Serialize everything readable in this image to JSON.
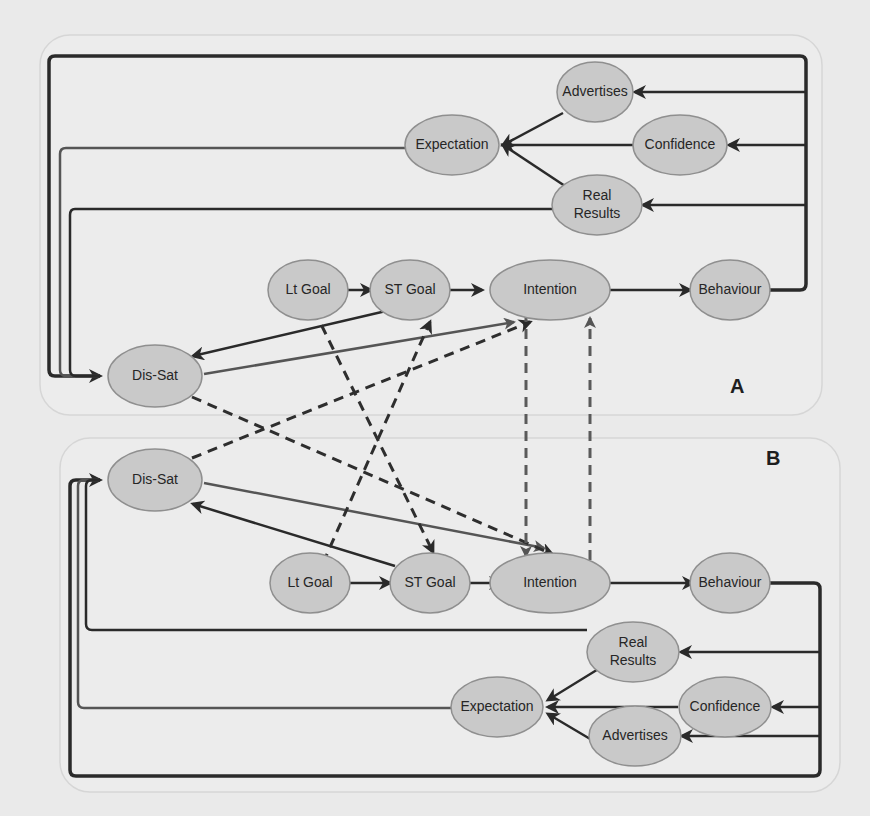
{
  "diagram": {
    "panels": [
      {
        "id": "A",
        "label": "A"
      },
      {
        "id": "B",
        "label": "B"
      }
    ],
    "nodes": {
      "a_advertises": {
        "label": "Advertises"
      },
      "a_expectation": {
        "label": "Expectation"
      },
      "a_confidence": {
        "label": "Confidence"
      },
      "a_real_results_line1": {
        "label": "Real"
      },
      "a_real_results_line2": {
        "label": "Results"
      },
      "a_lt_goal": {
        "label": "Lt Goal"
      },
      "a_st_goal": {
        "label": "ST Goal"
      },
      "a_intention": {
        "label": "Intention"
      },
      "a_behaviour": {
        "label": "Behaviour"
      },
      "a_dis_sat": {
        "label": "Dis-Sat"
      },
      "b_dis_sat": {
        "label": "Dis-Sat"
      },
      "b_lt_goal": {
        "label": "Lt Goal"
      },
      "b_st_goal": {
        "label": "ST Goal"
      },
      "b_intention": {
        "label": "Intention"
      },
      "b_behaviour": {
        "label": "Behaviour"
      },
      "b_real_results_line1": {
        "label": "Real"
      },
      "b_real_results_line2": {
        "label": "Results"
      },
      "b_expectation": {
        "label": "Expectation"
      },
      "b_confidence": {
        "label": "Confidence"
      },
      "b_advertises": {
        "label": "Advertises"
      }
    },
    "edges_solid": [
      {
        "from": "Lt Goal",
        "to": "ST Goal",
        "panel": "A"
      },
      {
        "from": "ST Goal",
        "to": "Intention",
        "panel": "A"
      },
      {
        "from": "Intention",
        "to": "Behaviour",
        "panel": "A"
      },
      {
        "from": "Advertises",
        "to": "Expectation",
        "panel": "A"
      },
      {
        "from": "Confidence",
        "to": "Expectation",
        "panel": "A"
      },
      {
        "from": "Real Results",
        "to": "Expectation",
        "panel": "A"
      },
      {
        "from": "Behaviour",
        "to": "Advertises",
        "panel": "A"
      },
      {
        "from": "Behaviour",
        "to": "Confidence",
        "panel": "A"
      },
      {
        "from": "Behaviour",
        "to": "Real Results",
        "panel": "A"
      },
      {
        "from": "Behaviour",
        "to": "Dis-Sat",
        "panel": "A"
      },
      {
        "from": "Expectation",
        "to": "Dis-Sat",
        "panel": "A"
      },
      {
        "from": "Real Results",
        "to": "Dis-Sat",
        "panel": "A"
      },
      {
        "from": "ST Goal",
        "to": "Dis-Sat",
        "panel": "A"
      },
      {
        "from": "Dis-Sat",
        "to": "Intention",
        "panel": "A"
      },
      {
        "from": "Lt Goal",
        "to": "ST Goal",
        "panel": "B"
      },
      {
        "from": "ST Goal",
        "to": "Intention",
        "panel": "B"
      },
      {
        "from": "Intention",
        "to": "Behaviour",
        "panel": "B"
      },
      {
        "from": "Real Results",
        "to": "Expectation",
        "panel": "B"
      },
      {
        "from": "Confidence",
        "to": "Expectation",
        "panel": "B"
      },
      {
        "from": "Advertises",
        "to": "Expectation",
        "panel": "B"
      },
      {
        "from": "Behaviour",
        "to": "Real Results",
        "panel": "B"
      },
      {
        "from": "Behaviour",
        "to": "Confidence",
        "panel": "B"
      },
      {
        "from": "Behaviour",
        "to": "Advertises",
        "panel": "B"
      },
      {
        "from": "Behaviour",
        "to": "Dis-Sat",
        "panel": "B"
      },
      {
        "from": "Expectation",
        "to": "Dis-Sat",
        "panel": "B"
      },
      {
        "from": "Real Results",
        "to": "Dis-Sat",
        "panel": "B"
      },
      {
        "from": "ST Goal",
        "to": "Dis-Sat",
        "panel": "B"
      },
      {
        "from": "Dis-Sat",
        "to": "Intention",
        "panel": "B"
      }
    ],
    "edges_dashed": [
      {
        "from": "A Lt Goal",
        "to": "B ST Goal"
      },
      {
        "from": "B Lt Goal",
        "to": "A ST Goal"
      },
      {
        "from": "A Dis-Sat",
        "to": "B Intention"
      },
      {
        "from": "B Dis-Sat",
        "to": "A Intention"
      },
      {
        "from": "A Intention",
        "to": "B Intention"
      },
      {
        "from": "B Intention",
        "to": "A Intention"
      }
    ],
    "colors": {
      "background": "#eaeaea",
      "panel_fill": "#ececec",
      "panel_stroke": "#d6d6d6",
      "node_fill": "#c9c9c9",
      "node_stroke": "#8f8f8f",
      "edge": "#2a2a2a",
      "edge_grey": "#555555",
      "text": "#262626"
    }
  }
}
